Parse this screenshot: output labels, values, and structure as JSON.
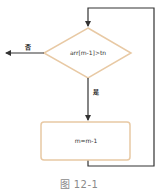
{
  "diagram": {
    "type": "flowchart",
    "colors": {
      "node_border": "#e8c9a4",
      "edge": "#333333",
      "caption": "#8a8a8a"
    },
    "nodes": {
      "decision": {
        "shape": "diamond",
        "label": "arr[m-1]>tn"
      },
      "process": {
        "shape": "rounded-rectangle",
        "label": "m=m-1"
      }
    },
    "edges": {
      "no_label": "否",
      "yes_label": "是"
    },
    "caption": "图 12-1"
  }
}
